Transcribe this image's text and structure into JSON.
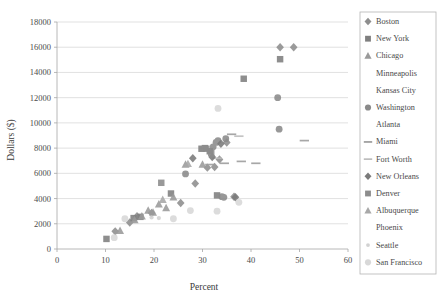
{
  "chart_data": {
    "type": "scatter",
    "title": "",
    "xlabel": "Percent",
    "ylabel": "Dollars ($)",
    "xlim": [
      0,
      60
    ],
    "ylim": [
      0,
      18000
    ],
    "x_ticks": [
      0,
      10,
      20,
      30,
      40,
      50,
      60
    ],
    "y_ticks": [
      0,
      2000,
      4000,
      6000,
      8000,
      10000,
      12000,
      14000,
      16000,
      18000
    ],
    "grid": "horizontal",
    "legend_position": "right",
    "series": [
      {
        "name": "Boston",
        "marker": "diamond",
        "color": "#8e8e8e",
        "points": [
          {
            "x": 12.0,
            "y": 1400
          },
          {
            "x": 15.0,
            "y": 2100
          },
          {
            "x": 16.5,
            "y": 2600
          },
          {
            "x": 19.5,
            "y": 2850
          },
          {
            "x": 25.5,
            "y": 3650
          },
          {
            "x": 28.5,
            "y": 5200
          },
          {
            "x": 31.0,
            "y": 6450
          },
          {
            "x": 32.5,
            "y": 6500
          },
          {
            "x": 33.5,
            "y": 7100
          },
          {
            "x": 35.0,
            "y": 8450
          },
          {
            "x": 36.5,
            "y": 4150
          },
          {
            "x": 46.0,
            "y": 16000
          },
          {
            "x": 48.8,
            "y": 16000
          }
        ]
      },
      {
        "name": "New York",
        "marker": "square",
        "color": "#7f7f7f",
        "points": [
          {
            "x": 10.2,
            "y": 800
          },
          {
            "x": 15.8,
            "y": 2450
          },
          {
            "x": 17.2,
            "y": 2550
          },
          {
            "x": 23.5,
            "y": 4400
          },
          {
            "x": 29.8,
            "y": 7950
          },
          {
            "x": 30.5,
            "y": 8000
          },
          {
            "x": 31.5,
            "y": 7750
          },
          {
            "x": 33.0,
            "y": 4250
          },
          {
            "x": 38.5,
            "y": 13500
          },
          {
            "x": 46.0,
            "y": 15050
          }
        ]
      },
      {
        "name": "Chicago",
        "marker": "triangle",
        "color": "#9a9a9a",
        "points": [
          {
            "x": 13.0,
            "y": 1450
          },
          {
            "x": 16.0,
            "y": 2300
          },
          {
            "x": 17.5,
            "y": 2600
          },
          {
            "x": 18.8,
            "y": 3050
          },
          {
            "x": 19.8,
            "y": 2900
          },
          {
            "x": 21.0,
            "y": 3550
          },
          {
            "x": 22.5,
            "y": 3250
          },
          {
            "x": 24.0,
            "y": 4100
          },
          {
            "x": 26.5,
            "y": 6700
          },
          {
            "x": 30.0,
            "y": 6700
          }
        ]
      },
      {
        "name": "Minneapolis",
        "marker": "x",
        "color": "#c0c0c0",
        "points": [
          {
            "x": 19.0,
            "y": 4350
          },
          {
            "x": 20.2,
            "y": 4400
          },
          {
            "x": 20.8,
            "y": 5050
          },
          {
            "x": 21.5,
            "y": 4350
          },
          {
            "x": 25.0,
            "y": 7700
          },
          {
            "x": 31.5,
            "y": 6050
          }
        ]
      },
      {
        "name": "Kansas City",
        "marker": "star",
        "color": "#c8c8c8",
        "points": [
          {
            "x": 17.5,
            "y": 3750
          },
          {
            "x": 18.0,
            "y": 4450
          },
          {
            "x": 20.5,
            "y": 5050
          },
          {
            "x": 21.5,
            "y": 2350
          },
          {
            "x": 22.0,
            "y": 2400
          },
          {
            "x": 34.5,
            "y": 8000
          },
          {
            "x": 44.5,
            "y": 9050
          }
        ]
      },
      {
        "name": "Washington",
        "marker": "circle",
        "color": "#8a8a8a",
        "points": [
          {
            "x": 26.5,
            "y": 5950
          },
          {
            "x": 32.2,
            "y": 8100
          },
          {
            "x": 32.8,
            "y": 8450
          },
          {
            "x": 33.2,
            "y": 8600
          },
          {
            "x": 34.0,
            "y": 4150
          },
          {
            "x": 34.4,
            "y": 4100
          },
          {
            "x": 34.8,
            "y": 8750
          },
          {
            "x": 45.5,
            "y": 12000
          },
          {
            "x": 45.8,
            "y": 9500
          }
        ]
      },
      {
        "name": "Atlanta",
        "marker": "plus",
        "color": "#b8b8b8",
        "points": [
          {
            "x": 18.5,
            "y": 5100
          },
          {
            "x": 20.0,
            "y": 5150
          },
          {
            "x": 22.5,
            "y": 5100
          },
          {
            "x": 25.8,
            "y": 1700
          },
          {
            "x": 27.5,
            "y": 1750
          },
          {
            "x": 35.5,
            "y": 7700
          },
          {
            "x": 45.5,
            "y": 10150
          }
        ]
      },
      {
        "name": "Miami",
        "marker": "dash",
        "color": "#9c9c9c",
        "points": [
          {
            "x": 31.5,
            "y": 6700
          },
          {
            "x": 34.5,
            "y": 6800
          },
          {
            "x": 36.0,
            "y": 9100
          },
          {
            "x": 38.0,
            "y": 6950
          },
          {
            "x": 41.0,
            "y": 6800
          },
          {
            "x": 51.0,
            "y": 8600
          }
        ]
      },
      {
        "name": "Fort Worth",
        "marker": "dash",
        "color": "#bdbdbd",
        "points": [
          {
            "x": 33.0,
            "y": 7200
          },
          {
            "x": 37.5,
            "y": 8950
          }
        ]
      },
      {
        "name": "New Orleans",
        "marker": "diamond",
        "color": "#7a7a7a",
        "points": [
          {
            "x": 28.0,
            "y": 7200
          },
          {
            "x": 32.0,
            "y": 7300
          },
          {
            "x": 33.8,
            "y": 8350
          },
          {
            "x": 36.8,
            "y": 4100
          }
        ]
      },
      {
        "name": "Denver",
        "marker": "square",
        "color": "#8c8c8c",
        "points": [
          {
            "x": 21.5,
            "y": 5250
          },
          {
            "x": 30.8,
            "y": 7950
          },
          {
            "x": 31.8,
            "y": 7600
          }
        ]
      },
      {
        "name": "Albuquerque",
        "marker": "triangle",
        "color": "#a8a8a8",
        "points": [
          {
            "x": 21.8,
            "y": 3900
          },
          {
            "x": 27.0,
            "y": 6750
          }
        ]
      },
      {
        "name": "Phoenix",
        "marker": "none",
        "color": "#d6d6d6",
        "points": []
      },
      {
        "name": "Seattle",
        "marker": "dot-small",
        "color": "#d2d2d2",
        "points": [
          {
            "x": 19.5,
            "y": 2500
          },
          {
            "x": 21.0,
            "y": 2450
          }
        ]
      },
      {
        "name": "San Francisco",
        "marker": "circle",
        "color": "#d8d8d8",
        "points": [
          {
            "x": 11.8,
            "y": 900
          },
          {
            "x": 14.0,
            "y": 2400
          },
          {
            "x": 24.0,
            "y": 2400
          },
          {
            "x": 27.5,
            "y": 3050
          },
          {
            "x": 33.2,
            "y": 11150
          },
          {
            "x": 33.0,
            "y": 3000
          },
          {
            "x": 37.5,
            "y": 3700
          }
        ]
      }
    ]
  },
  "legend": {
    "items": [
      {
        "label": "Boston"
      },
      {
        "label": "New York"
      },
      {
        "label": "Chicago"
      },
      {
        "label": "Minneapolis"
      },
      {
        "label": "Kansas City"
      },
      {
        "label": "Washington"
      },
      {
        "label": "Atlanta"
      },
      {
        "label": "Miami"
      },
      {
        "label": "Fort Worth"
      },
      {
        "label": "New Orleans"
      },
      {
        "label": "Denver"
      },
      {
        "label": "Albuquerque"
      },
      {
        "label": "Phoenix"
      },
      {
        "label": "Seattle"
      },
      {
        "label": "San Francisco"
      }
    ]
  },
  "colors": {
    "grid": "#d4d4d4",
    "axis": "#a6a6a6",
    "text": "#4a4a4a",
    "legend_border": "#b5b5b5",
    "background": "#ffffff"
  }
}
